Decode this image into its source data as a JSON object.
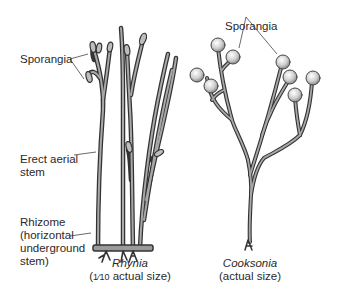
{
  "figure": {
    "labels": {
      "sporangia_left": "Sporangia",
      "sporangia_right": "Sporangia",
      "erect_stem_line1": "Erect aerial",
      "erect_stem_line2": "stem",
      "rhizome_line1": "Rhizome",
      "rhizome_line2": "(horizontal",
      "rhizome_line3": "underground",
      "rhizome_line4": "stem)"
    },
    "plants": [
      {
        "name": "Rhynia",
        "scale_prefix": "(",
        "scale_fraction": "1⁄10",
        "scale_suffix": " actual size)"
      },
      {
        "name": "Cooksonia",
        "scale": "(actual size)"
      }
    ],
    "colors": {
      "stem_outline": "#3a3a3a",
      "stem_fill": "#9a9a9a",
      "sporangium_fill": "#d8d8d8",
      "leader_line": "#444444"
    }
  }
}
